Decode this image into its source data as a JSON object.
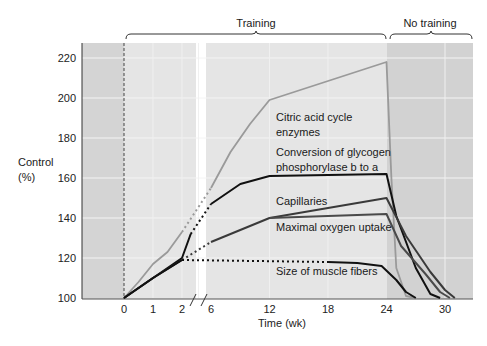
{
  "chart_data": {
    "type": "line",
    "title": "",
    "xlabel": "Time (wk)",
    "ylabel": "Control (%)",
    "ylabel_lines": [
      "Control",
      "(%)"
    ],
    "ylim": [
      100,
      225
    ],
    "yticks": [
      100,
      120,
      140,
      160,
      180,
      200,
      220
    ],
    "xticks": [
      0,
      1,
      2,
      6,
      12,
      18,
      24,
      30
    ],
    "axis_break": "between 2 and 6 weeks",
    "grid": true,
    "regions": [
      {
        "label": "Training",
        "from": 0,
        "to": 24
      },
      {
        "label": "No training",
        "from": 24,
        "to": 32
      }
    ],
    "series": [
      {
        "name": "Citric acid cycle enzymes",
        "name_lines": [
          "Citric acid cycle",
          "enzymes"
        ],
        "color": "#9a9a9a",
        "points": [
          [
            0,
            100
          ],
          [
            0.5,
            108
          ],
          [
            1,
            117
          ],
          [
            1.5,
            123
          ],
          [
            2,
            133
          ],
          [
            6,
            155
          ],
          [
            8,
            173
          ],
          [
            10,
            187
          ],
          [
            12,
            199
          ],
          [
            24,
            218
          ],
          [
            24.5,
            160
          ],
          [
            25,
            115
          ],
          [
            26,
            101
          ],
          [
            27,
            100
          ]
        ]
      },
      {
        "name": "Conversion of glycogen phosphorylase b to a",
        "name_lines": [
          "Conversion of glycogen",
          "phosphorylase b to a"
        ],
        "color": "#111111",
        "points": [
          [
            0,
            100
          ],
          [
            1,
            110
          ],
          [
            2,
            120
          ],
          [
            2.3,
            132
          ],
          [
            6,
            147
          ],
          [
            9,
            157
          ],
          [
            12,
            161
          ],
          [
            24,
            162
          ],
          [
            25,
            141
          ],
          [
            27,
            115
          ],
          [
            28.5,
            102
          ],
          [
            29.5,
            100
          ]
        ]
      },
      {
        "name": "Capillaries",
        "name_lines": [
          "Capillaries"
        ],
        "color": "#3a3a3a",
        "points": [
          [
            0,
            100
          ],
          [
            1,
            110
          ],
          [
            2,
            119
          ],
          [
            6,
            128
          ],
          [
            12,
            140
          ],
          [
            24,
            150
          ],
          [
            26,
            131
          ],
          [
            28.5,
            113
          ],
          [
            30,
            104
          ],
          [
            31,
            100
          ]
        ]
      },
      {
        "name": "Maximal oxygen uptake",
        "name_lines": [
          "Maximal oxygen uptake"
        ],
        "color": "#4a4a4a",
        "points": [
          [
            12,
            140
          ],
          [
            24,
            142
          ],
          [
            25.5,
            126
          ],
          [
            28,
            112
          ],
          [
            29.5,
            103
          ],
          [
            30.5,
            100
          ]
        ]
      },
      {
        "name": "Size of muscle fibers",
        "name_lines": [
          "Size of muscle fibers"
        ],
        "color": "#111111",
        "points": [
          [
            0,
            100
          ],
          [
            1,
            110
          ],
          [
            2,
            119
          ],
          [
            18,
            118
          ],
          [
            21,
            117.5
          ],
          [
            23.5,
            116
          ],
          [
            25,
            109
          ],
          [
            26,
            103
          ],
          [
            27,
            100
          ]
        ]
      }
    ]
  }
}
